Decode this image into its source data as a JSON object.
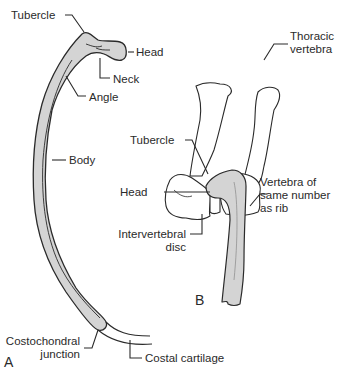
{
  "figure": {
    "panels": [
      {
        "id": "A",
        "label": "A"
      },
      {
        "id": "B",
        "label": "B"
      }
    ],
    "colors": {
      "bone_fill": "#d4d4d4",
      "outline": "#2a2a2a",
      "text": "#2a2a2a",
      "background": "#ffffff"
    }
  },
  "panel_a": {
    "labels": {
      "tubercle": "Tubercle",
      "head": "Head",
      "neck": "Neck",
      "angle": "Angle",
      "body": "Body",
      "costochondral_1": "Costochondral",
      "costochondral_2": "junction",
      "costal_cartilage": "Costal cartilage"
    }
  },
  "panel_b": {
    "labels": {
      "thoracic_1": "Thoracic",
      "thoracic_2": "vertebra",
      "tubercle": "Tubercle",
      "head": "Head",
      "vertebra_1": "Vertebra of",
      "vertebra_2": "same number",
      "vertebra_3": "as rib",
      "disc_1": "Intervertebral",
      "disc_2": "disc"
    }
  }
}
